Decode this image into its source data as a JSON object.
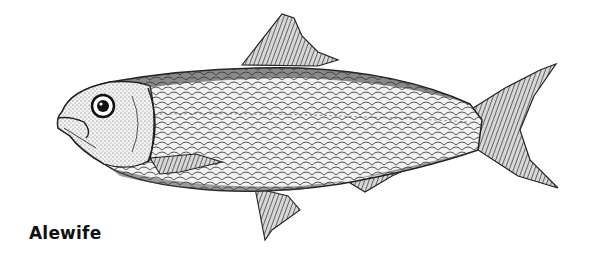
{
  "illustration": {
    "subject": "fish-illustration",
    "style": "black and white engraving",
    "caption": "Alewife",
    "colors": {
      "background": "#ffffff",
      "ink": "#1a1a1a"
    }
  }
}
